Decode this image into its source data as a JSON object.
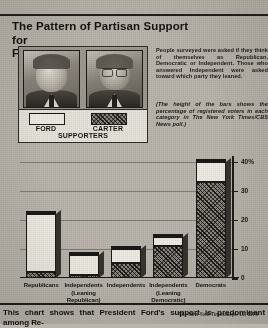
{
  "headline": {
    "line1": "The Pattern of Partisan Support  for",
    "line2": "Ford and Carter"
  },
  "blurb": {
    "main": "People surveyed were asked if they think of themselves as Republican, Democratic or Independent. Those who answered Independent were asked toward which party they leaned.",
    "italic": "(The height of the bars shows the percentage of registered voters in each category in The New York Times/CBS News poll.)"
  },
  "legend": {
    "ford_label": "FORD",
    "carter_label": "CARTER",
    "sub_label": "SUPPORTERS",
    "ford_swatch": "#efece4",
    "carter_swatch": "#8a857c"
  },
  "photos": [
    {
      "name": "ford-photo",
      "person": "Ford"
    },
    {
      "name": "carter-photo",
      "person": "Carter"
    }
  ],
  "credit": "The New York Times/Sept. 10, 1976",
  "caption": "This chart shows that President Ford's support is predominant among Re-",
  "chart_data": {
    "type": "bar",
    "stacked": true,
    "title": "The Pattern of Partisan Support for Ford and Carter",
    "xlabel": "",
    "ylabel": "",
    "ylim": [
      0,
      42
    ],
    "yticks": [
      0,
      10,
      20,
      30,
      40
    ],
    "ytick_labels": [
      "0",
      "10",
      "20",
      "30",
      "40%"
    ],
    "grid": true,
    "legend_position": "top-left",
    "categories": [
      "Republicans",
      "Independents (Leaning Republican)",
      "Independents",
      "Independents (Leaning Democratic)",
      "Democrats"
    ],
    "category_lines": [
      [
        "Republicans"
      ],
      [
        "Independents",
        "(Leaning",
        "Republican)"
      ],
      [
        "Independents"
      ],
      [
        "Independents",
        "(Leaning",
        "Democratic)"
      ],
      [
        "Democrats"
      ]
    ],
    "series": [
      {
        "name": "Ford supporters",
        "values": [
          20,
          7,
          5,
          3,
          7
        ]
      },
      {
        "name": "Carter supporters",
        "values": [
          2,
          1,
          5,
          11,
          33
        ]
      }
    ],
    "totals": [
      22,
      8,
      10,
      14,
      40
    ]
  }
}
